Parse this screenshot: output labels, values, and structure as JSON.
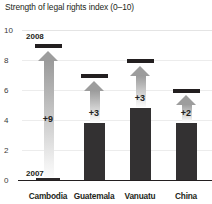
{
  "chart_data": {
    "type": "bar",
    "title": "Strength of legal rights index (0–10)",
    "xlabel": "",
    "ylabel": "",
    "ylim": [
      0,
      10
    ],
    "yticks": [
      "0",
      "2",
      "4",
      "6",
      "8",
      "10"
    ],
    "grid": true,
    "legend": "none",
    "categories": [
      "Cambodia",
      "Guatemala",
      "Vanuatu",
      "China"
    ],
    "series": [
      {
        "name": "2007",
        "values": [
          0,
          3.8,
          4.8,
          3.8
        ]
      },
      {
        "name": "2008",
        "values": [
          9,
          6.8,
          7.8,
          5.8
        ]
      }
    ],
    "deltas": [
      "+9",
      "+3",
      "+3",
      "+2"
    ],
    "annotations": {
      "start_year": "2007",
      "end_year": "2008"
    },
    "colors": {
      "bar": "#333132",
      "marker": "#231f20",
      "arrow": "#9d9d9d",
      "grid": "#ececec",
      "text": "#231f20"
    }
  },
  "axis": {
    "ticks": [
      {
        "label": "10",
        "value": 10
      },
      {
        "label": "8",
        "value": 8
      },
      {
        "label": "6",
        "value": 6
      },
      {
        "label": "4",
        "value": 4
      },
      {
        "label": "2",
        "value": 2
      },
      {
        "label": "0",
        "value": 0
      }
    ]
  }
}
